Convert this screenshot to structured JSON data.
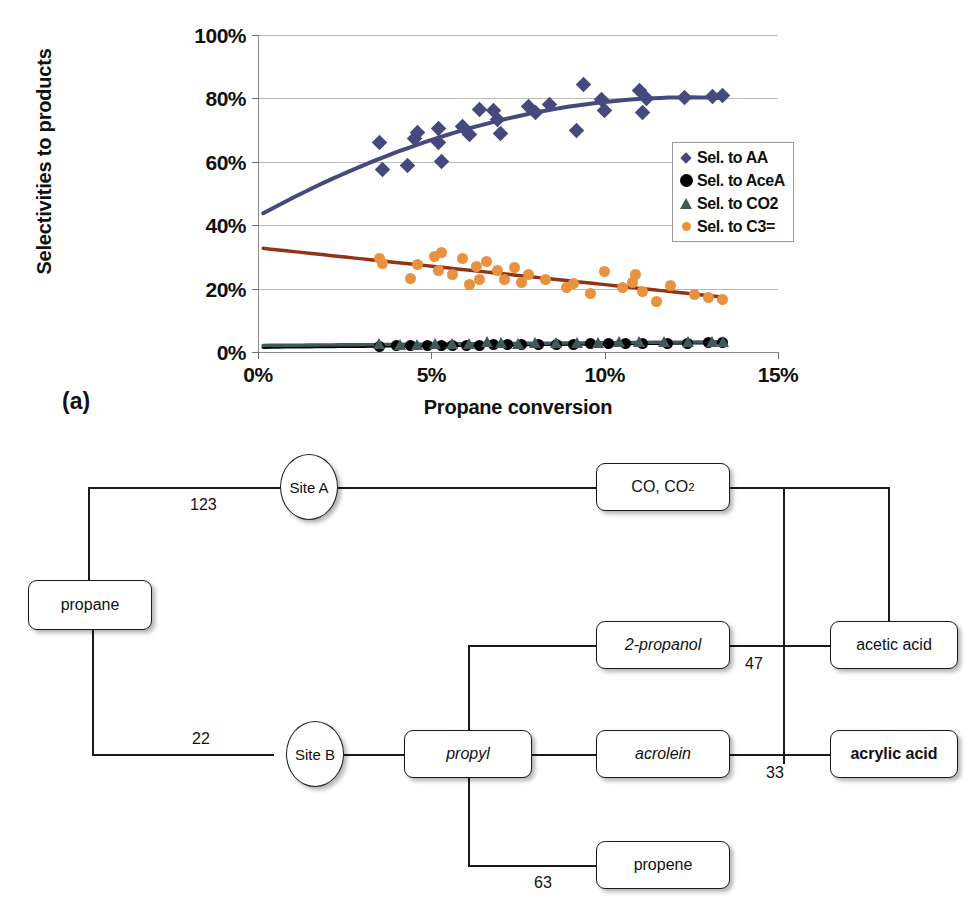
{
  "figure": {
    "panel_a_label": "(a)",
    "panel_b_label": "(b)"
  },
  "chart_data": {
    "type": "scatter",
    "title": "",
    "xlabel": "Propane conversion",
    "ylabel": "Selectivities to products",
    "xlim": [
      0,
      15
    ],
    "ylim": [
      0,
      100
    ],
    "xtick_labels": [
      "0%",
      "5%",
      "10%",
      "15%"
    ],
    "xticks": [
      0,
      5,
      10,
      15
    ],
    "ytick_labels": [
      "0%",
      "20%",
      "40%",
      "60%",
      "80%",
      "100%"
    ],
    "yticks": [
      0,
      20,
      40,
      60,
      80,
      100
    ],
    "grid": "horizontal",
    "legend_position": "center-right",
    "series": [
      {
        "name": "Sel. to AA",
        "marker": "diamond",
        "color": "#46497e",
        "trend": "polynomial",
        "trend_color": "#46497e",
        "points": [
          [
            3.5,
            66.0
          ],
          [
            3.6,
            57.5
          ],
          [
            4.3,
            58.8
          ],
          [
            4.5,
            67.5
          ],
          [
            4.6,
            69.2
          ],
          [
            5.2,
            70.5
          ],
          [
            5.2,
            66.0
          ],
          [
            5.3,
            60.0
          ],
          [
            5.9,
            71.0
          ],
          [
            6.1,
            68.5
          ],
          [
            6.4,
            76.5
          ],
          [
            6.8,
            76.3
          ],
          [
            6.9,
            73.5
          ],
          [
            7.0,
            69.0
          ],
          [
            7.8,
            77.5
          ],
          [
            8.0,
            75.5
          ],
          [
            8.4,
            78.0
          ],
          [
            9.2,
            70.0
          ],
          [
            9.4,
            84.5
          ],
          [
            9.9,
            79.5
          ],
          [
            10.0,
            76.3
          ],
          [
            11.0,
            82.5
          ],
          [
            11.1,
            75.5
          ],
          [
            11.2,
            80.0
          ],
          [
            12.3,
            80.3
          ],
          [
            13.1,
            80.5
          ],
          [
            13.4,
            81.0
          ]
        ]
      },
      {
        "name": "Sel. to AceA",
        "marker": "circle",
        "color": "#000000",
        "trend": "linear",
        "trend_color": "#000000",
        "points": [
          [
            3.5,
            1.8
          ],
          [
            4.0,
            1.9
          ],
          [
            4.4,
            2.0
          ],
          [
            4.9,
            2.0
          ],
          [
            5.3,
            2.1
          ],
          [
            5.6,
            2.1
          ],
          [
            6.0,
            2.2
          ],
          [
            6.4,
            2.2
          ],
          [
            6.8,
            2.3
          ],
          [
            7.2,
            2.3
          ],
          [
            7.6,
            2.4
          ],
          [
            8.1,
            2.4
          ],
          [
            8.6,
            2.5
          ],
          [
            9.1,
            2.5
          ],
          [
            9.6,
            2.6
          ],
          [
            10.1,
            2.6
          ],
          [
            10.6,
            2.7
          ],
          [
            11.1,
            2.7
          ],
          [
            11.8,
            2.8
          ],
          [
            12.4,
            2.8
          ],
          [
            13.0,
            2.9
          ],
          [
            13.4,
            2.9
          ]
        ]
      },
      {
        "name": "Sel. to CO2",
        "marker": "triangle",
        "color": "#41595a",
        "trend": "linear",
        "trend_color": "#41595a",
        "points": [
          [
            3.5,
            2.6
          ],
          [
            4.1,
            2.2
          ],
          [
            4.6,
            2.3
          ],
          [
            5.1,
            2.5
          ],
          [
            5.6,
            2.4
          ],
          [
            6.1,
            2.6
          ],
          [
            6.6,
            3.0
          ],
          [
            7.0,
            2.8
          ],
          [
            7.5,
            2.6
          ],
          [
            8.0,
            2.7
          ],
          [
            8.6,
            2.8
          ],
          [
            9.2,
            2.8
          ],
          [
            9.8,
            2.9
          ],
          [
            10.4,
            3.2
          ],
          [
            11.0,
            3.0
          ],
          [
            11.7,
            3.0
          ],
          [
            12.4,
            3.1
          ],
          [
            13.1,
            3.2
          ],
          [
            13.4,
            3.2
          ]
        ]
      },
      {
        "name": "Sel. to C3=",
        "marker": "circle",
        "color": "#e8913f",
        "trend": "linear",
        "trend_color": "#8f3416",
        "points": [
          [
            3.5,
            29.5
          ],
          [
            3.6,
            27.8
          ],
          [
            4.4,
            23.3
          ],
          [
            4.6,
            27.5
          ],
          [
            5.1,
            30.0
          ],
          [
            5.2,
            25.8
          ],
          [
            5.3,
            31.5
          ],
          [
            5.6,
            24.5
          ],
          [
            5.9,
            29.5
          ],
          [
            6.1,
            21.2
          ],
          [
            6.3,
            27.0
          ],
          [
            6.4,
            23.0
          ],
          [
            6.6,
            28.5
          ],
          [
            6.9,
            25.8
          ],
          [
            7.1,
            22.8
          ],
          [
            7.4,
            26.5
          ],
          [
            7.6,
            22.0
          ],
          [
            7.8,
            24.5
          ],
          [
            8.3,
            23.0
          ],
          [
            8.9,
            20.3
          ],
          [
            9.1,
            21.5
          ],
          [
            9.6,
            18.6
          ],
          [
            10.0,
            25.3
          ],
          [
            10.5,
            20.2
          ],
          [
            10.8,
            21.8
          ],
          [
            10.9,
            24.5
          ],
          [
            11.1,
            19.0
          ],
          [
            11.5,
            16.0
          ],
          [
            11.9,
            21.0
          ],
          [
            12.6,
            18.0
          ],
          [
            13.0,
            17.2
          ],
          [
            13.4,
            16.5
          ]
        ]
      }
    ]
  },
  "diagram": {
    "nodes": [
      {
        "id": "propane",
        "label": "propane",
        "shape": "box",
        "style": "normal"
      },
      {
        "id": "site-a",
        "label": "Site A",
        "shape": "circle",
        "style": "normal"
      },
      {
        "id": "site-b",
        "label": "Site B",
        "shape": "circle",
        "style": "normal"
      },
      {
        "id": "co-co2",
        "label": "CO, CO2",
        "shape": "box",
        "style": "normal"
      },
      {
        "id": "2-propanol",
        "label": "2-propanol",
        "shape": "box",
        "style": "italic"
      },
      {
        "id": "acetic-acid",
        "label": "acetic acid",
        "shape": "box",
        "style": "normal"
      },
      {
        "id": "propyl",
        "label": "propyl",
        "shape": "box",
        "style": "italic"
      },
      {
        "id": "acrolein",
        "label": "acrolein",
        "shape": "box",
        "style": "italic"
      },
      {
        "id": "acrylic-acid",
        "label": "acrylic acid",
        "shape": "box",
        "style": "bold"
      },
      {
        "id": "propene",
        "label": "propene",
        "shape": "box",
        "style": "normal"
      }
    ],
    "edge_labels": {
      "propane_site_a": "123",
      "propane_site_b": "22",
      "propanol_acetic": "47",
      "acrolein_acrylic": "33",
      "propyl_propene": "63"
    }
  }
}
